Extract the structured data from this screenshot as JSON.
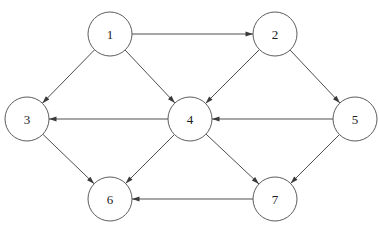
{
  "figure": {
    "kind": "directed-graph",
    "background_color": "#ffffff",
    "node_fill": "#ffffff",
    "node_stroke": "#4a4a4a",
    "edge_color": "#3a3a3a",
    "label_color": "#1c1c1c",
    "node_radius": 22,
    "width": 379,
    "height": 227
  },
  "nodes": [
    {
      "id": "1",
      "label": "1",
      "x": 110,
      "y": 34
    },
    {
      "id": "2",
      "label": "2",
      "x": 275,
      "y": 34
    },
    {
      "id": "3",
      "label": "3",
      "x": 27,
      "y": 119
    },
    {
      "id": "4",
      "label": "4",
      "x": 190,
      "y": 119
    },
    {
      "id": "5",
      "label": "5",
      "x": 355,
      "y": 119
    },
    {
      "id": "6",
      "label": "6",
      "x": 110,
      "y": 199
    },
    {
      "id": "7",
      "label": "7",
      "x": 275,
      "y": 199
    }
  ],
  "edges": [
    {
      "from": "1",
      "to": "2",
      "directed": true
    },
    {
      "from": "1",
      "to": "3",
      "directed": true
    },
    {
      "from": "1",
      "to": "4",
      "directed": true
    },
    {
      "from": "2",
      "to": "4",
      "directed": true
    },
    {
      "from": "2",
      "to": "5",
      "directed": true
    },
    {
      "from": "4",
      "to": "3",
      "directed": true
    },
    {
      "from": "5",
      "to": "4",
      "directed": true
    },
    {
      "from": "3",
      "to": "6",
      "directed": true
    },
    {
      "from": "4",
      "to": "6",
      "directed": true
    },
    {
      "from": "4",
      "to": "7",
      "directed": true
    },
    {
      "from": "5",
      "to": "7",
      "directed": true
    },
    {
      "from": "7",
      "to": "6",
      "directed": true
    }
  ]
}
